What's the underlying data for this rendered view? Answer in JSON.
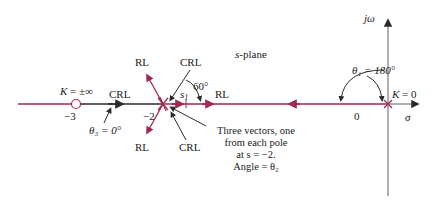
{
  "diagram": {
    "title": "s-plane",
    "axes": {
      "imag_label": "jω",
      "real_label": "σ",
      "origin_label": "0"
    },
    "colors": {
      "root_locus": "#a0294f",
      "complementary": "#2b2b2b",
      "axis": "#7a7a7a",
      "text": "#222222"
    },
    "zero": {
      "position": -3,
      "label": "−3",
      "gain_label": "K = ±∞"
    },
    "poles_cluster": {
      "position": -2,
      "label": "−2",
      "multiplicity": 3
    },
    "pole_origin": {
      "position": 0,
      "gain_label": "K = 0"
    },
    "branch_labels": {
      "rl_upper": "RL",
      "crl_upper": "CRL",
      "rl_lower": "RL",
      "crl_lower": "CRL",
      "crl_left": "CRL",
      "rl_right": "RL"
    },
    "test_point": {
      "label": "s",
      "subscript": "1"
    },
    "angles": {
      "theta1": "θ₁ = 180°",
      "theta3": "θ₃ = 0°",
      "sixty": "60°"
    },
    "note": {
      "line1": "Three vectors, one",
      "line2": "from each pole",
      "line3": "at s = −2.",
      "line4": "Angle = θ₂"
    }
  }
}
